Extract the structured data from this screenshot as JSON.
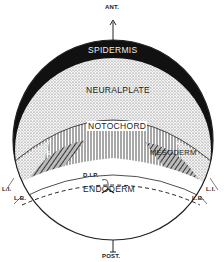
{
  "diagram": {
    "orientation": {
      "top": "ANT.",
      "bottom": "POST."
    },
    "regions": {
      "epidermis": "SPIDERMIS",
      "neural_plate": "NEURALPLATE",
      "notochord": "NOTOCHORD",
      "mesoderm": "MESODERM",
      "endoderm": "ENDODERM",
      "somite_mark": "S"
    },
    "markers": {
      "dlp": "D.I.P.",
      "li_left": "L.I.",
      "li_right": "L.I.",
      "lb_left": "L.B.",
      "lb_right": "L.B."
    }
  }
}
